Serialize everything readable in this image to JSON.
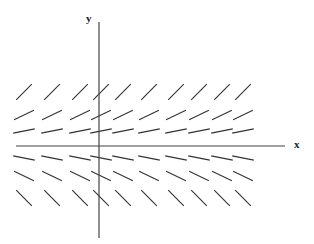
{
  "figure": {
    "type": "slope-field",
    "width": 314,
    "height": 244,
    "axes": {
      "x_label": "x",
      "y_label": "y",
      "origin_px": [
        99,
        146
      ],
      "x_axis_px": [
        16,
        285
      ],
      "y_axis_px": [
        22,
        238
      ],
      "axis_color": "#444444"
    },
    "segment_color": "#333333",
    "segment_length": 22,
    "columns_px": [
      24,
      52,
      80,
      101,
      123,
      149,
      176,
      199,
      222,
      243
    ],
    "rows": [
      {
        "y_px": 92,
        "angle_deg": 45
      },
      {
        "y_px": 115,
        "angle_deg": 26
      },
      {
        "y_px": 131,
        "angle_deg": 11
      },
      {
        "y_px": 158,
        "angle_deg": -11
      },
      {
        "y_px": 176,
        "angle_deg": -26
      },
      {
        "y_px": 198,
        "angle_deg": -45
      }
    ]
  }
}
